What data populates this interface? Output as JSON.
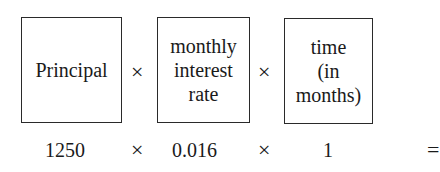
{
  "boxes": [
    {
      "lines": [
        "Principal"
      ]
    },
    {
      "lines": [
        "monthly",
        "interest",
        "rate"
      ]
    },
    {
      "lines": [
        "time",
        "(in months)"
      ]
    }
  ],
  "operator": "×",
  "values": [
    "1250",
    "0.016",
    "1"
  ],
  "equals": "= "
}
